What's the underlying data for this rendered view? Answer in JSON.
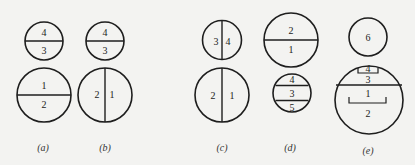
{
  "figure": {
    "panels": [
      {
        "caption": "(a)",
        "top": {
          "labels": [
            "4",
            "3"
          ],
          "divider": "horizontal"
        },
        "bottom": {
          "labels": [
            "1",
            "2"
          ],
          "divider": "horizontal"
        }
      },
      {
        "caption": "(b)",
        "top": {
          "labels": [
            "4",
            "3"
          ],
          "divider": "horizontal"
        },
        "bottom": {
          "labels": [
            "2",
            "1"
          ],
          "divider": "vertical"
        }
      },
      {
        "caption": "(c)",
        "top": {
          "labels": [
            "3",
            "4"
          ],
          "divider": "vertical"
        },
        "bottom": {
          "labels": [
            "2",
            "1"
          ],
          "divider": "vertical"
        }
      },
      {
        "caption": "(d)",
        "top": {
          "labels": [
            "2",
            "1"
          ],
          "divider": "horizontal"
        },
        "bottom": {
          "labels": [
            "4",
            "3",
            "5"
          ],
          "divider": "two-horizontal"
        }
      },
      {
        "caption": "(e)",
        "top": {
          "labels": [
            "6"
          ],
          "divider": "none"
        },
        "bottom": {
          "labels": [
            "4",
            "3",
            "1",
            "2"
          ],
          "divider": "horizontal-with-brackets"
        }
      }
    ]
  },
  "colors": {
    "stroke": "#1e1e1e",
    "background": "#f3f3f1"
  }
}
